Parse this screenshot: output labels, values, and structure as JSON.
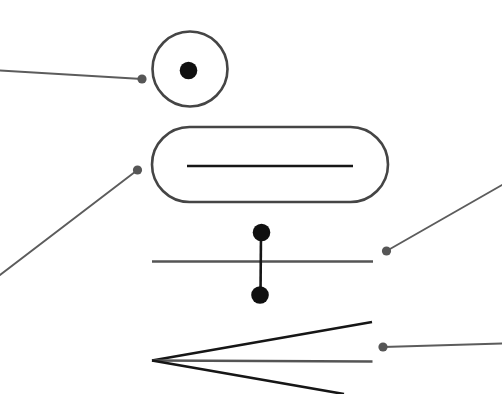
{
  "figure": {
    "width": 502,
    "height": 394,
    "background_color": "#ffffff"
  },
  "colors": {
    "symbol_outline": "#454545",
    "symbol_black": "#161616",
    "symbol_gray": "#555555",
    "leader": "#5c5c5c",
    "filled_dot": "#101010"
  },
  "symbols": {
    "circle_dot": {
      "label": "circle with center dot",
      "outline_path": "M 152.5 69 a 37.5 37.5 0 1 0 75 0 a 37.5 37.5 0 1 0 -75 0",
      "center_dot": {
        "cx": 188.5,
        "cy": 70.5,
        "r": 8.8
      },
      "leader_path": "M 0 70.5 L 142 79",
      "leader_dot": {
        "cx": 142,
        "cy": 79,
        "r": 4.6
      }
    },
    "capsule": {
      "label": "rounded capsule with inner horizontal line",
      "rect": {
        "x": 152,
        "y": 127,
        "width": 236,
        "height": 75,
        "rx": 37.5
      },
      "inner_line_path": "M 187 166 L 353 166",
      "leader_path": "M 137.5 170 L 0 275",
      "leader_dot": {
        "cx": 137.5,
        "cy": 170,
        "r": 4.6
      }
    },
    "crossbar_dumbbell": {
      "label": "horizontal line crossed by vertical bar with dots at both ends",
      "horizontal_line_path": "M 152 261.5 L 373 261.5",
      "vertical_line_path": "M 261 232.5 L 260.5 295",
      "top_dot": {
        "cx": 261.5,
        "cy": 232.5,
        "r": 8.8
      },
      "bottom_dot": {
        "cx": 260,
        "cy": 295,
        "r": 8.8
      },
      "leader_path": "M 386.5 251 L 502 185",
      "leader_dot": {
        "cx": 386.5,
        "cy": 251,
        "r": 4.6
      }
    },
    "converging_lines": {
      "label": "three lines converging to a point at the left",
      "top_line_path": "M 152 360.5 L 372 322",
      "middle_line_path": "M 152 360.5 L 372.5 361.5",
      "bottom_line_path": "M 152 360.5 L 344 394",
      "leader_path": "M 383 347 L 502 343.5",
      "leader_dot": {
        "cx": 383,
        "cy": 347,
        "r": 4.6
      }
    }
  }
}
